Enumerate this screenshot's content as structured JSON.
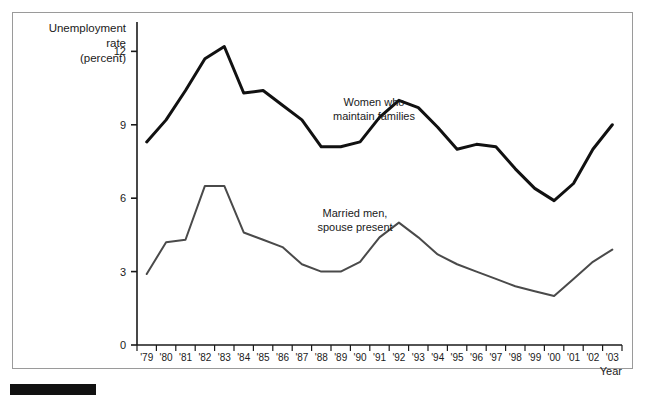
{
  "figure": {
    "background_color": "#ffffff",
    "frame_color": "#9a9a9a",
    "source_bar_color": "#111111"
  },
  "axis": {
    "y_title_line1": "Unemployment",
    "y_title_line2": "rate",
    "y_title_line3": "(percent)",
    "x_title": "Year",
    "y_ticks": [
      "0",
      "3",
      "6",
      "9",
      "12"
    ],
    "x_ticks": [
      "'79",
      "'80",
      "'81",
      "'82",
      "'83",
      "'84",
      "'85",
      "'86",
      "'87",
      "'88",
      "'89",
      "'90",
      "'91",
      "'92",
      "'93",
      "'94",
      "'95",
      "'96",
      "'97",
      "'98",
      "'99",
      "'00",
      "'01",
      "'02",
      "'03"
    ]
  },
  "annotations": {
    "women_line1": "Women who",
    "women_line2": "maintain families",
    "married_line1": "Married men,",
    "married_line2": "spouse present"
  },
  "chart_data": {
    "type": "line",
    "title": "",
    "xlabel": "Year",
    "ylabel": "Unemployment rate (percent)",
    "xlim": [
      "'79",
      "'03"
    ],
    "ylim": [
      0,
      13.2
    ],
    "yticks": [
      0,
      3,
      6,
      9,
      12
    ],
    "grid": false,
    "legend": "inline annotations",
    "x": [
      "'79",
      "'80",
      "'81",
      "'82",
      "'83",
      "'84",
      "'85",
      "'86",
      "'87",
      "'88",
      "'89",
      "'90",
      "'91",
      "'92",
      "'93",
      "'94",
      "'95",
      "'96",
      "'97",
      "'98",
      "'99",
      "'00",
      "'01",
      "'02",
      "'03"
    ],
    "series": [
      {
        "name": "Women who maintain families",
        "color": "#111111",
        "line_width": 3.0,
        "values": [
          8.3,
          9.2,
          10.4,
          11.7,
          12.2,
          10.3,
          10.4,
          9.8,
          9.2,
          8.1,
          8.1,
          8.3,
          9.3,
          10.0,
          9.7,
          8.9,
          8.0,
          8.2,
          8.1,
          7.2,
          6.4,
          5.9,
          6.6,
          8.0,
          9.0
        ]
      },
      {
        "name": "Married men, spouse present",
        "color": "#4a4a4a",
        "line_width": 2.0,
        "values": [
          2.9,
          4.2,
          4.3,
          6.5,
          6.5,
          4.6,
          4.3,
          4.0,
          3.3,
          3.0,
          3.0,
          3.4,
          4.4,
          5.0,
          4.4,
          3.7,
          3.3,
          3.0,
          2.7,
          2.4,
          2.2,
          2.0,
          2.7,
          3.4,
          3.9
        ]
      }
    ]
  }
}
